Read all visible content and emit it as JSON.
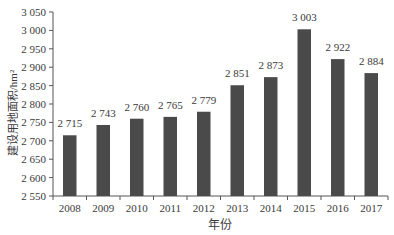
{
  "chart_data": {
    "type": "bar",
    "title": "",
    "xlabel": "年份",
    "ylabel": "建设用地面积/hm²",
    "categories": [
      "2008",
      "2009",
      "2010",
      "2011",
      "2012",
      "2013",
      "2014",
      "2015",
      "2016",
      "2017"
    ],
    "values": [
      2715,
      2743,
      2760,
      2765,
      2779,
      2851,
      2873,
      3003,
      2922,
      2884
    ],
    "data_labels": [
      "2 715",
      "2 743",
      "2 760",
      "2 765",
      "2 779",
      "2 851",
      "2 873",
      "3 003",
      "2 922",
      "2 884"
    ],
    "ylim": [
      2550,
      3050
    ],
    "yticks": [
      2550,
      2600,
      2650,
      2700,
      2750,
      2800,
      2850,
      2900,
      2950,
      3000,
      3050
    ],
    "ytick_labels": [
      "2 550",
      "2 600",
      "2 650",
      "2 700",
      "2 750",
      "2 800",
      "2 850",
      "2 900",
      "2 950",
      "3 000",
      "3 050"
    ],
    "grid": false,
    "legend": null,
    "colors": {
      "bar": "#4a4a4a",
      "axis": "#555555",
      "text": "#3a3a3a"
    }
  }
}
